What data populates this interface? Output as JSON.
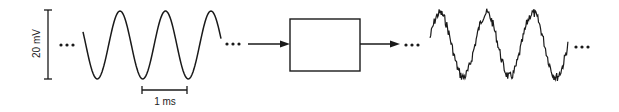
{
  "diagram": {
    "input_signal": {
      "type": "clean sine wave",
      "cycles_shown": 3
    },
    "process_block": {
      "label": ""
    },
    "output_signal": {
      "type": "noisy sine wave",
      "cycles_shown": 3
    },
    "scale_bars": {
      "vertical": {
        "label": "20 mV"
      },
      "horizontal": {
        "label": "1 ms"
      }
    },
    "continuation_marks": "..."
  },
  "colors": {
    "ink": "#1a1a1a",
    "background": "#ffffff"
  }
}
